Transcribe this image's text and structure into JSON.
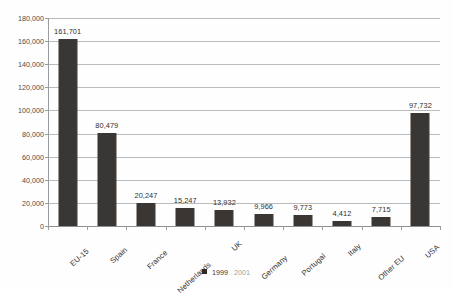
{
  "chart_data": {
    "type": "bar",
    "title": "",
    "subtitle": "",
    "xlabel": "",
    "ylabel": "",
    "ylim": [
      0,
      180000
    ],
    "ytick_step": 20000,
    "grid": true,
    "legend_position": "bottom-center",
    "categories": [
      "EU-15",
      "Spain",
      "France",
      "Netherlands",
      "UK",
      "Germany",
      "Portugal",
      "Italy",
      "Other EU",
      "USA"
    ],
    "values": [
      161701,
      80479,
      20247,
      15247,
      13932,
      9966,
      9773,
      4412,
      7715,
      97732
    ],
    "data_labels": [
      "161,701",
      "80,479",
      "20,247",
      "15,247",
      "13,932",
      "9,966",
      "9,773",
      "4,412",
      "7,715",
      "97,732"
    ],
    "ytick_labels": [
      "180,000",
      "160,000",
      "140,000",
      "120,000",
      "100,000",
      "80,000",
      "60,000",
      "40,000",
      "20,000",
      "0"
    ],
    "ytick_values": [
      180000,
      160000,
      140000,
      120000,
      100000,
      80000,
      60000,
      40000,
      20000,
      0
    ],
    "series": [
      {
        "name": "1999",
        "color": "#2e2a27",
        "values": [
          161701,
          80479,
          20247,
          15247,
          13932,
          9966,
          9773,
          4412,
          7715,
          97732
        ]
      }
    ],
    "legend": [
      {
        "label": "1999",
        "color": "#2e2a27"
      },
      {
        "label": "2001",
        "color": "#9aa79a"
      }
    ],
    "colors": {
      "bar": "#3a3633",
      "gridline": "#b9bbbd",
      "axis": "#9a9c9e",
      "text": "#2e2e2e",
      "background": "#ffffff"
    }
  }
}
